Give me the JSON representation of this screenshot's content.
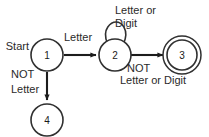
{
  "diagram": {
    "type": "finite-state-machine",
    "background_color": "#ffffff",
    "line_color": "#1c1c1c",
    "text_color": "#2a2a2a",
    "states": [
      {
        "id": "1",
        "label": "1",
        "cx": 47,
        "cy": 55,
        "r": 16,
        "accepting": false,
        "start": true
      },
      {
        "id": "2",
        "label": "2",
        "cx": 115,
        "cy": 55,
        "r": 16,
        "accepting": false,
        "start": false
      },
      {
        "id": "3",
        "label": "3",
        "cx": 182,
        "cy": 55,
        "r": 15,
        "accepting": true,
        "start": false
      },
      {
        "id": "4",
        "label": "4",
        "cx": 47,
        "cy": 120,
        "r": 16,
        "accepting": false,
        "start": false
      }
    ],
    "start_label": "Start",
    "transitions": [
      {
        "from": "1",
        "to": "2",
        "label": "Letter",
        "label_lines": [
          "Letter"
        ]
      },
      {
        "from": "2",
        "to": "2",
        "label": "Letter or Digit",
        "label_lines": [
          "Letter or",
          "Digit"
        ],
        "self_loop": true
      },
      {
        "from": "2",
        "to": "3",
        "label": "NOT Letter or Digit",
        "label_lines": [
          "NOT",
          "Letter or Digit"
        ]
      },
      {
        "from": "1",
        "to": "4",
        "label": "NOT Letter",
        "label_lines": [
          "NOT",
          "Letter"
        ]
      }
    ],
    "labels": {
      "start": "Start",
      "letter": "Letter",
      "loop_line1": "Letter or",
      "loop_line2": "Digit",
      "not_letter_digit_line1": "NOT",
      "not_letter_digit_line2": "Letter or Digit",
      "not_letter_line1": "NOT",
      "not_letter_line2": "Letter"
    }
  }
}
